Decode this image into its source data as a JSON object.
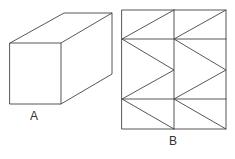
{
  "figures": [
    {
      "id": "A",
      "label": "A",
      "description": "Rectangular prism (cuboid) drawn in oblique projection",
      "front_face": {
        "x1": 10,
        "y1": 43,
        "x2": 61,
        "y2": 104
      },
      "depth_offset": {
        "dx": 53,
        "dy": -30
      }
    },
    {
      "id": "B",
      "label": "B",
      "description": "Net/grid of 2 columns with horizontal divisions and zigzag diagonals",
      "columns_x": [
        122,
        174,
        226
      ],
      "rows_y": [
        10,
        39,
        99,
        129
      ],
      "diagonal_mid_y": 70
    }
  ],
  "colors": {
    "stroke": "#444444",
    "background": "#ffffff",
    "label": "#333333"
  }
}
